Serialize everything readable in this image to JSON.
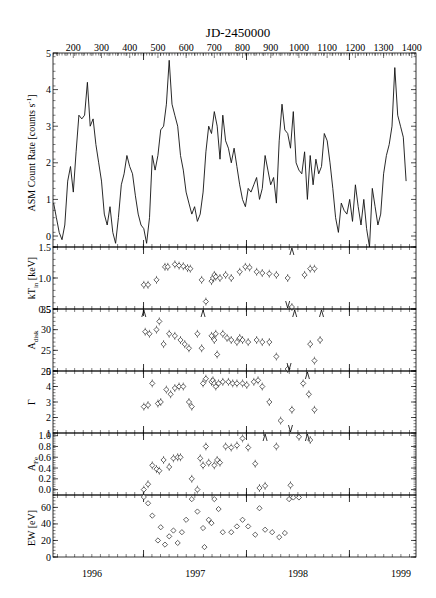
{
  "chart_data": {
    "type": "multi-panel",
    "title": "JD-2450000",
    "top_axis": {
      "label": "JD-2450000",
      "ticks": [
        200,
        300,
        400,
        500,
        600,
        700,
        800,
        900,
        1000,
        1100,
        1200,
        1300,
        1400
      ],
      "range": [
        128,
        1415
      ]
    },
    "bottom_axis": {
      "label": "",
      "ticks": [
        "1996",
        "1997",
        "1998",
        "1999"
      ]
    },
    "panels": [
      {
        "id": "asm",
        "type": "line",
        "ylabel": "ASM Count Rate [counts s⁻¹]",
        "ylim": [
          -0.3,
          5
        ],
        "yticks": [
          0,
          1,
          2,
          3,
          4,
          5
        ],
        "x": [
          130,
          140,
          150,
          160,
          170,
          180,
          190,
          200,
          210,
          220,
          230,
          240,
          250,
          260,
          270,
          280,
          290,
          300,
          310,
          320,
          330,
          340,
          350,
          360,
          370,
          380,
          390,
          400,
          410,
          420,
          430,
          440,
          450,
          460,
          470,
          480,
          490,
          500,
          510,
          520,
          530,
          540,
          550,
          560,
          570,
          580,
          590,
          600,
          610,
          620,
          630,
          640,
          650,
          660,
          670,
          680,
          690,
          700,
          710,
          720,
          730,
          740,
          750,
          760,
          770,
          780,
          790,
          800,
          810,
          820,
          830,
          840,
          850,
          860,
          870,
          880,
          890,
          900,
          910,
          920,
          930,
          940,
          950,
          960,
          970,
          980,
          990,
          1000,
          1010,
          1020,
          1030,
          1040,
          1050,
          1060,
          1070,
          1080,
          1090,
          1100,
          1110,
          1120,
          1130,
          1140,
          1150,
          1160,
          1170,
          1180,
          1190,
          1200,
          1210,
          1220,
          1230,
          1240,
          1250,
          1260,
          1270,
          1280,
          1290,
          1300,
          1310,
          1320,
          1330,
          1340,
          1350,
          1360,
          1370,
          1380
        ],
        "values": [
          0.9,
          0.5,
          0.1,
          -0.1,
          0.3,
          1.5,
          1.9,
          1.2,
          2.3,
          3.3,
          3.2,
          3.3,
          4.2,
          3.0,
          3.2,
          2.5,
          2.0,
          1.5,
          0.6,
          0.3,
          0.8,
          0.1,
          -0.2,
          0.5,
          1.4,
          1.7,
          2.2,
          1.9,
          1.7,
          1.1,
          0.6,
          0.3,
          0.2,
          -0.2,
          0.5,
          2.2,
          1.8,
          2.2,
          2.9,
          3.0,
          3.6,
          4.8,
          3.6,
          3.3,
          3.0,
          2.2,
          1.8,
          1.2,
          0.9,
          0.6,
          0.8,
          0.4,
          0.6,
          1.2,
          2.3,
          3.0,
          2.8,
          3.4,
          3.0,
          2.1,
          3.3,
          2.6,
          2.4,
          2.0,
          2.4,
          1.9,
          1.4,
          1.0,
          0.8,
          1.3,
          1.2,
          1.4,
          1.6,
          1.0,
          1.3,
          2.2,
          1.8,
          1.4,
          1.6,
          0.9,
          2.6,
          3.6,
          2.9,
          2.8,
          2.4,
          3.4,
          2.0,
          1.8,
          1.7,
          2.3,
          1.0,
          2.2,
          1.4,
          2.1,
          1.7,
          1.9,
          2.8,
          2.6,
          2.0,
          1.3,
          0.5,
          0.1,
          0.9,
          0.7,
          0.6,
          1.0,
          0.4,
          1.4,
          0.8,
          0.3,
          1.0,
          0.2,
          -0.3,
          1.3,
          0.8,
          0.3,
          0.6,
          1.7,
          2.2,
          2.5,
          3.0,
          4.6,
          3.3,
          3.0,
          2.7,
          1.5
        ]
      },
      {
        "id": "kTin",
        "type": "scatter",
        "ylabel": "kT_in [keV]",
        "ylim": [
          0.5,
          1.5
        ],
        "yticks": [
          0.5,
          1.0,
          1.5
        ],
        "x": [
          450,
          465,
          495,
          525,
          535,
          560,
          575,
          590,
          605,
          615,
          655,
          670,
          690,
          695,
          700,
          705,
          720,
          740,
          760,
          790,
          810,
          825,
          850,
          870,
          895,
          920,
          960,
          975,
          1020,
          1040,
          1055
        ],
        "values": [
          0.89,
          0.89,
          0.97,
          1.18,
          1.18,
          1.22,
          1.2,
          1.19,
          1.16,
          1.15,
          0.97,
          0.62,
          0.95,
          1.0,
          1.05,
          1.02,
          1.0,
          1.05,
          1.0,
          1.1,
          1.18,
          1.17,
          1.1,
          1.08,
          1.07,
          1.05,
          1.0,
          0.5,
          1.05,
          1.15,
          1.15
        ],
        "upper_limits_x": [
          960
        ],
        "lower_limits_x": [
          975
        ]
      },
      {
        "id": "Adisk",
        "type": "scatter",
        "ylabel": "A_disk",
        "ylim": [
          20,
          35
        ],
        "yticks": [
          20,
          25,
          30,
          35
        ],
        "x": [
          455,
          470,
          495,
          505,
          520,
          540,
          560,
          580,
          595,
          610,
          640,
          655,
          690,
          700,
          705,
          710,
          730,
          745,
          760,
          780,
          790,
          800,
          820,
          850,
          870,
          895,
          920,
          960,
          1040,
          1055,
          1075
        ],
        "values": [
          29.5,
          29.0,
          30.0,
          32.0,
          26.5,
          29.0,
          28.5,
          27.5,
          26.5,
          25.5,
          29.0,
          25.5,
          28.5,
          27.5,
          29.0,
          24.0,
          29.0,
          28.0,
          27.5,
          27.0,
          28.0,
          27.5,
          27.0,
          27.5,
          27.0,
          27.0,
          23.5,
          20.2,
          26.5,
          22.5,
          27.5
        ],
        "lower_limits_x": [
          450,
          660,
          985,
          1080
        ],
        "upper_limits_x": [
          965
        ]
      },
      {
        "id": "Gamma",
        "type": "scatter",
        "ylabel": "Γ",
        "ylim": [
          1,
          5
        ],
        "yticks": [
          1,
          2,
          3,
          4,
          5
        ],
        "x": [
          450,
          465,
          480,
          500,
          510,
          530,
          545,
          560,
          575,
          590,
          610,
          620,
          660,
          670,
          690,
          695,
          700,
          705,
          715,
          730,
          750,
          765,
          780,
          800,
          815,
          840,
          855,
          870,
          895,
          935,
          975,
          1015,
          1035,
          1055
        ],
        "values": [
          2.7,
          2.8,
          4.2,
          2.9,
          3.0,
          3.8,
          3.5,
          3.9,
          4.0,
          4.0,
          3.0,
          2.7,
          4.2,
          4.5,
          4.3,
          4.4,
          4.2,
          4.0,
          4.2,
          4.3,
          4.3,
          4.2,
          4.2,
          4.2,
          4.1,
          4.3,
          4.4,
          4.0,
          3.0,
          1.8,
          2.5,
          4.2,
          3.5,
          2.5
        ],
        "upper_limits_x": [
          970
        ],
        "lower_limits_x": [
          1030
        ]
      },
      {
        "id": "Afe",
        "type": "scatter",
        "ylabel": "A_Fe",
        "ylim": [
          -0.1,
          1.05
        ],
        "yticks": [
          0.0,
          0.2,
          0.4,
          0.6,
          0.8,
          1.0
        ],
        "x": [
          450,
          465,
          480,
          495,
          505,
          520,
          540,
          555,
          570,
          580,
          620,
          640,
          650,
          660,
          670,
          680,
          700,
          710,
          720,
          740,
          760,
          780,
          800,
          820,
          845,
          860,
          880,
          920,
          970,
          1000,
          1040
        ],
        "values": [
          0.0,
          0.1,
          0.45,
          0.38,
          0.35,
          0.55,
          0.42,
          0.58,
          0.6,
          0.6,
          0.2,
          0.0,
          0.58,
          0.45,
          0.8,
          0.5,
          0.45,
          0.55,
          0.5,
          0.8,
          0.78,
          0.82,
          0.95,
          0.78,
          0.48,
          0.03,
          0.07,
          0.8,
          0.08,
          0.98,
          0.92
        ],
        "lower_limits_x": [
          880,
          1030
        ]
      },
      {
        "id": "EW",
        "type": "scatter",
        "ylabel": "EW [eV]",
        "ylim": [
          0,
          75
        ],
        "yticks": [
          0,
          20,
          40,
          60
        ],
        "x": [
          450,
          465,
          480,
          500,
          510,
          525,
          540,
          555,
          570,
          585,
          600,
          620,
          640,
          660,
          665,
          680,
          690,
          700,
          715,
          730,
          760,
          780,
          800,
          820,
          845,
          860,
          880,
          905,
          930,
          950,
          965,
          980,
          1000
        ],
        "values": [
          75,
          65,
          50,
          20,
          36,
          15,
          25,
          32,
          17,
          30,
          45,
          70,
          55,
          35,
          12,
          45,
          41,
          70,
          58,
          30,
          30,
          37,
          45,
          37,
          27,
          59,
          33,
          30,
          24,
          29,
          70,
          72,
          72
        ]
      }
    ]
  },
  "labels": {
    "title": "JD-2450000",
    "asm_ylabel": "ASM Count Rate [counts s",
    "asm_ylabel_sup": "-1",
    "asm_ylabel_end": "]",
    "kt_ylabel": "kT",
    "kt_ylabel_sub": "in",
    "kt_ylabel_end": " [keV]",
    "adisk_ylabel": "A",
    "adisk_ylabel_sub": "disk",
    "gamma_ylabel": "Γ",
    "afe_ylabel": "A",
    "afe_ylabel_sub": "Fe",
    "ew_ylabel": "EW [eV]",
    "years": [
      "1996",
      "1997",
      "1998",
      "1999"
    ]
  }
}
